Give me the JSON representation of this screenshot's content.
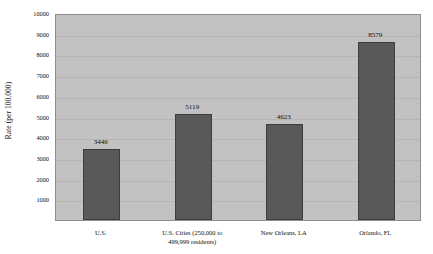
{
  "chart_data": {
    "type": "bar",
    "title": "",
    "xlabel": "",
    "ylabel": "Rate (per 100,000)",
    "categories": [
      "U.S.",
      "U.S. Cities (250,000 to 499,999 residents)",
      "New Orleans, LA",
      "Orlando, FL"
    ],
    "values": [
      3446,
      5119,
      4623,
      8579
    ],
    "value_labels": [
      "3446",
      "5119",
      "4623",
      "8579"
    ],
    "ylim": [
      0,
      10000
    ],
    "yticks": [
      1000,
      2000,
      3000,
      4000,
      5000,
      6000,
      7000,
      8000,
      9000,
      10000
    ],
    "ytick_labels": [
      "1000",
      "2000",
      "3000",
      "4000",
      "5000",
      "6000",
      "7000",
      "8000",
      "9000",
      "10000"
    ],
    "grid": true,
    "legend": null,
    "colors": {
      "bar_fill": "#595959",
      "bar_border": "#3d3d3d",
      "plot_background": "#c2c2c2",
      "figure_background": "#ffffff",
      "gridline": "#b5b5b5",
      "axis_border": "#8e8e8e",
      "text": "#111111"
    }
  },
  "category_lines": [
    [
      "U.S."
    ],
    [
      "U.S. Cities (250,000 to",
      "499,999 residents)"
    ],
    [
      "New Orleans, LA"
    ],
    [
      "Orlando, FL"
    ]
  ]
}
